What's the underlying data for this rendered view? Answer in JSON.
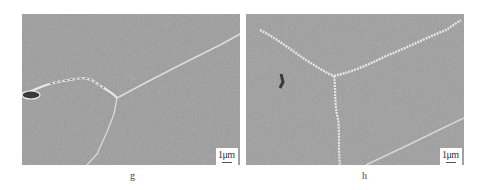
{
  "figure": {
    "panels": [
      {
        "id": "g",
        "label": "g",
        "scale_bar": "1μm"
      },
      {
        "id": "h",
        "label": "h",
        "scale_bar": "1μm"
      }
    ]
  },
  "colors": {
    "background": "#ffffff",
    "micrograph_gray": "#9a9a9a",
    "grain_boundary": "#e0e0e0"
  }
}
